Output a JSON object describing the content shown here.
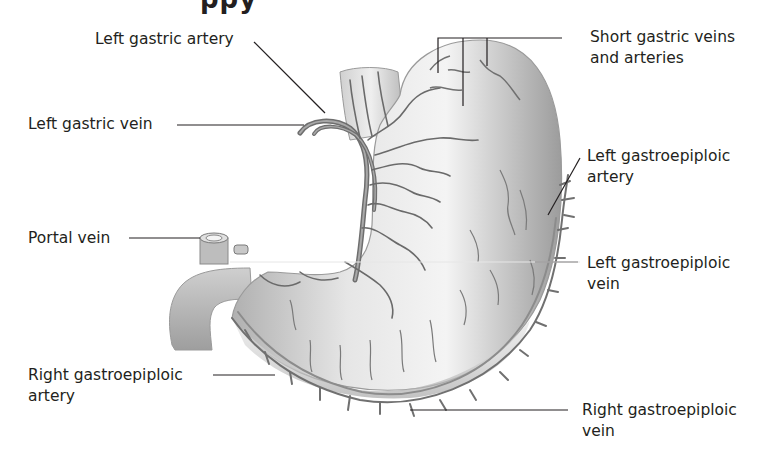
{
  "figure": {
    "title_fragment": "ppy",
    "colors": {
      "stomach_fill_light": "#f2f2f2",
      "stomach_fill_dark": "#9a9a9a",
      "vessel": "#6e6e6e",
      "vessel_dark": "#555555",
      "leader_line": "#231f20",
      "text": "#231f20"
    }
  },
  "labels": {
    "left_gastric_artery": "Left gastric artery",
    "left_gastric_vein": "Left gastric vein",
    "portal_vein": "Portal vein",
    "right_gastroepiploic_artery_line1": "Right gastroepiploic",
    "right_gastroepiploic_artery_line2": "artery",
    "short_gastric_line1": "Short gastric veins",
    "short_gastric_line2": "and arteries",
    "left_gastroepiploic_artery_line1": "Left gastroepiploic",
    "left_gastroepiploic_artery_line2": "artery",
    "left_gastroepiploic_vein_line1": "Left gastroepiploic",
    "left_gastroepiploic_vein_line2": "vein",
    "right_gastroepiploic_vein_line1": "Right gastroepiploic",
    "right_gastroepiploic_vein_line2": "vein"
  }
}
